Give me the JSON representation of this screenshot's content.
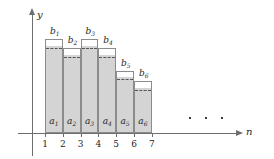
{
  "figure": {
    "axes": {
      "y_label": "y",
      "x_label": "n",
      "x_ticks": [
        "1",
        "2",
        "3",
        "4",
        "5",
        "6",
        "7"
      ]
    },
    "colors": {
      "fill": "#d4d4d4",
      "outline": "#8c8c8c",
      "axis": "#6e6e6e",
      "dashed": "#555555",
      "text": "#262626"
    },
    "ellipsis": "· · ·",
    "bars": [
      {
        "index": "1",
        "a_label": "a",
        "a_sub": "1",
        "b_label": "b",
        "b_sub": "1",
        "x_start": 1,
        "x_end": 2,
        "total_height": 94,
        "a_height": 86
      },
      {
        "index": "2",
        "a_label": "a",
        "a_sub": "2",
        "b_label": "b",
        "b_sub": "2",
        "x_start": 2,
        "x_end": 3,
        "total_height": 85,
        "a_height": 77
      },
      {
        "index": "3",
        "a_label": "a",
        "a_sub": "3",
        "b_label": "b",
        "b_sub": "3",
        "x_start": 3,
        "x_end": 4,
        "total_height": 94,
        "a_height": 86
      },
      {
        "index": "4",
        "a_label": "a",
        "a_sub": "4",
        "b_label": "b",
        "b_sub": "4",
        "x_start": 4,
        "x_end": 5,
        "total_height": 85,
        "a_height": 77
      },
      {
        "index": "5",
        "a_label": "a",
        "a_sub": "5",
        "b_label": "b",
        "b_sub": "5",
        "x_start": 5,
        "x_end": 6,
        "total_height": 62,
        "a_height": 55
      },
      {
        "index": "6",
        "a_label": "a",
        "a_sub": "6",
        "b_label": "b",
        "b_sub": "6",
        "x_start": 6,
        "x_end": 7,
        "total_height": 52,
        "a_height": 44
      }
    ]
  },
  "chart_data": {
    "type": "bar",
    "title": "",
    "xlabel": "n",
    "ylabel": "y",
    "categories": [
      "1",
      "2",
      "3",
      "4",
      "5",
      "6"
    ],
    "series": [
      {
        "name": "a",
        "values": [
          86,
          77,
          86,
          77,
          55,
          44
        ]
      },
      {
        "name": "b",
        "values": [
          94,
          85,
          94,
          85,
          62,
          52
        ]
      }
    ],
    "xlim": [
      0,
      8
    ],
    "ylim": [
      0,
      120
    ],
    "grid": false,
    "legend": "none",
    "annotations": [
      "b_1",
      "b_2",
      "b_3",
      "b_4",
      "b_5",
      "b_6",
      "a_1",
      "a_2",
      "a_3",
      "a_4",
      "a_5",
      "a_6",
      "· · ·"
    ]
  }
}
